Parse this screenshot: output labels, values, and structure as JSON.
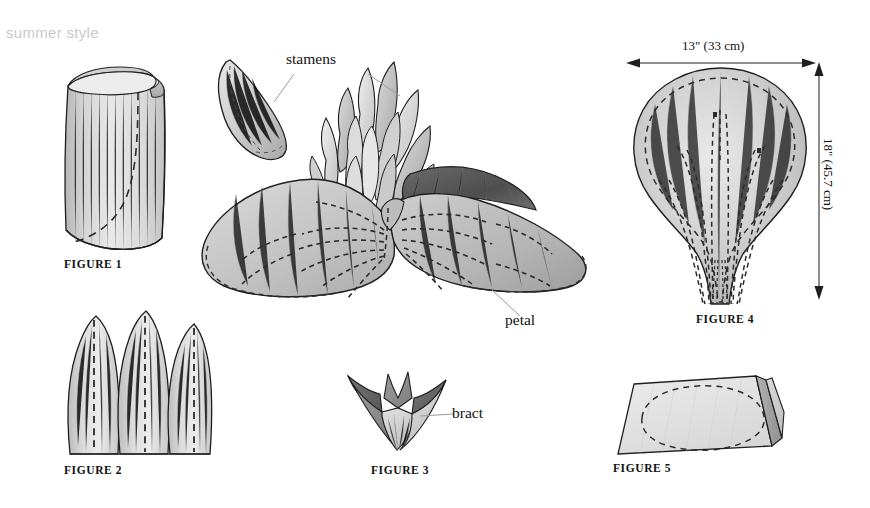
{
  "page": {
    "running_head": "summer style",
    "background_color": "#ffffff",
    "ink_color": "#111111",
    "running_head_color": "#c9c9c9"
  },
  "figures": [
    {
      "id": "figure-1",
      "caption": "FIGURE 1",
      "subject": "rolled-fabric-cylinder"
    },
    {
      "id": "figure-2",
      "caption": "FIGURE 2",
      "subject": "three-pointed-petals"
    },
    {
      "id": "figure-3",
      "caption": "FIGURE 3",
      "subject": "bract-crown"
    },
    {
      "id": "figure-4",
      "caption": "FIGURE 4",
      "subject": "large-petal-pattern"
    },
    {
      "id": "figure-5",
      "caption": "FIGURE 5",
      "subject": "folded-fabric-with-ellipse"
    }
  ],
  "callouts": [
    {
      "id": "stamens",
      "label": "stamens"
    },
    {
      "id": "petal",
      "label": "petal"
    },
    {
      "id": "bract",
      "label": "bract"
    }
  ],
  "dimensions": [
    {
      "id": "width",
      "label": "13\" (33 cm)",
      "orientation": "horizontal"
    },
    {
      "id": "height",
      "label": "18\" (45.7 cm)",
      "orientation": "vertical"
    }
  ],
  "palette": {
    "paper": "#ffffff",
    "outline": "#1f1f1f",
    "wash_light": "#e3e3e3",
    "wash_mid": "#c8c8c8",
    "wash_dark": "#9a9a9a",
    "wash_deep": "#6e6e6e",
    "shadow": "#4a4a4a",
    "dash": "#2b2b2b"
  }
}
